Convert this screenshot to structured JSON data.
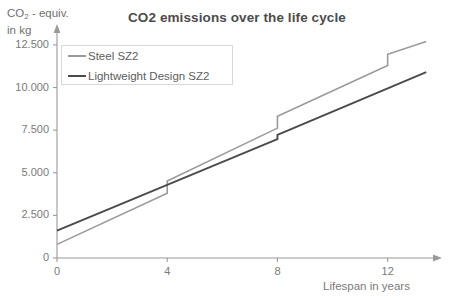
{
  "chart_data": {
    "type": "line",
    "title": "CO2 emissions over the life cycle",
    "ylabel_line1_prefix": "CO",
    "ylabel_line1_sub": "2",
    "ylabel_line1_suffix": " - equiv.",
    "ylabel_line2": "in kg",
    "xlabel": "Lifespan in years",
    "xlim": [
      0,
      13.5
    ],
    "ylim": [
      0,
      13200
    ],
    "xticks": [
      0,
      4,
      8,
      12
    ],
    "xticklabels": [
      "0",
      "4",
      "8",
      "12"
    ],
    "yticks": [
      0,
      2500,
      5000,
      7500,
      10000,
      12500
    ],
    "yticklabels": [
      "0",
      "2.500",
      "5.000",
      "7.500",
      "10.000",
      "12.500"
    ],
    "grid": false,
    "legend_position": "upper-left",
    "axis_arrows": true,
    "series": [
      {
        "name": "Steel SZ2",
        "color": "#9a9a9a",
        "linewidth": 1.6,
        "points": [
          [
            0,
            800
          ],
          [
            4,
            3800
          ],
          [
            4,
            4520
          ],
          [
            8,
            7620
          ],
          [
            8,
            8320
          ],
          [
            12,
            11300
          ],
          [
            12,
            11950
          ],
          [
            13.4,
            12700
          ]
        ]
      },
      {
        "name": "Lightweight Design SZ2",
        "color": "#4a4a4a",
        "linewidth": 1.9,
        "points": [
          [
            0,
            1600
          ],
          [
            8,
            6980
          ],
          [
            8,
            7230
          ],
          [
            13.4,
            10900
          ]
        ]
      }
    ]
  },
  "axes": {
    "axis_color": "#9a9a9a",
    "tick_color": "#9a9a9a"
  },
  "legend": {
    "items": [
      {
        "label": "Steel SZ2",
        "color": "#9a9a9a",
        "width": "2.2px"
      },
      {
        "label": "Lightweight Design SZ2",
        "color": "#4a4a4a",
        "width": "2.8px"
      }
    ]
  }
}
